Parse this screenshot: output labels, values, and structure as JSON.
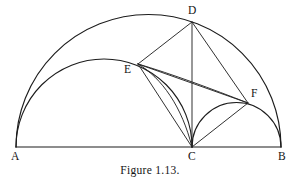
{
  "figure": {
    "caption": "Figure 1.13.",
    "stroke_color": "#1c1c1c",
    "background_color": "#ffffff",
    "width": 300,
    "height": 188
  },
  "labels": {
    "a": "A",
    "b": "B",
    "c": "C",
    "d": "D",
    "e": "E",
    "f": "F"
  },
  "geometry": {
    "baseline_y": 147,
    "points": {
      "A": {
        "x": 16,
        "y": 147
      },
      "B": {
        "x": 281,
        "y": 147
      },
      "C": {
        "x": 192,
        "y": 147
      },
      "D": {
        "x": 192,
        "y": 22
      },
      "E": {
        "x": 138,
        "y": 64
      },
      "F": {
        "x": 248,
        "y": 103
      }
    },
    "arcs": [
      {
        "name": "semicircle-AB",
        "from": "A",
        "to": "B",
        "center_x": 148.5,
        "radius": 132.5
      },
      {
        "name": "semicircle-AC",
        "from": "A",
        "to": "C",
        "center_x": 104,
        "radius": 88
      },
      {
        "name": "semicircle-CB",
        "from": "C",
        "to": "B",
        "center_x": 236.5,
        "radius": 44.5
      },
      {
        "name": "arc-EC",
        "from": "E",
        "to": "C"
      },
      {
        "name": "arc-EF",
        "from": "E",
        "to": "F"
      }
    ],
    "segments": [
      {
        "name": "segment-AB",
        "from": "A",
        "to": "B"
      },
      {
        "name": "segment-DE",
        "from": "D",
        "to": "E"
      },
      {
        "name": "segment-DC",
        "from": "D",
        "to": "C"
      },
      {
        "name": "segment-DF",
        "from": "D",
        "to": "F"
      },
      {
        "name": "segment-EC",
        "from": "E",
        "to": "C"
      },
      {
        "name": "segment-EF",
        "from": "E",
        "to": "F"
      },
      {
        "name": "segment-CF",
        "from": "C",
        "to": "F"
      }
    ]
  }
}
